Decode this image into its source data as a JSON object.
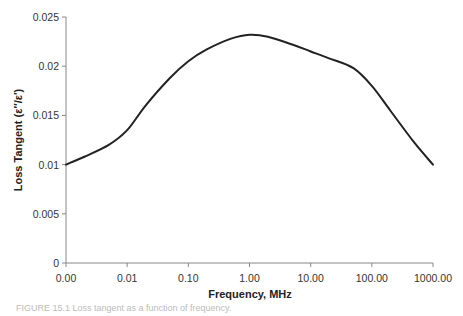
{
  "chart_data": {
    "type": "line",
    "title": "",
    "xlabel": "Frequency, MHz",
    "ylabel": "Loss Tangent (ε″/ε′)",
    "x_scale": "log",
    "x_tick_labels": [
      "0.00",
      "0.01",
      "0.10",
      "1.00",
      "10.00",
      "100.00",
      "1000.00"
    ],
    "y_tick_labels": [
      "0",
      "0.005",
      "0.01",
      "0.015",
      "0.02",
      "0.025"
    ],
    "y_ticks": [
      0,
      0.005,
      0.01,
      0.015,
      0.02,
      0.025
    ],
    "ylim": [
      0,
      0.025
    ],
    "grid": false,
    "legend": null,
    "series": [
      {
        "name": "Loss Tangent",
        "color": "#222222",
        "x": [
          0.001,
          0.002,
          0.005,
          0.01,
          0.02,
          0.05,
          0.1,
          0.2,
          0.5,
          1.0,
          2.0,
          5.0,
          10.0,
          20.0,
          50.0,
          100.0,
          200.0,
          500.0,
          1000.0
        ],
        "values": [
          0.01,
          0.0108,
          0.012,
          0.0135,
          0.016,
          0.0188,
          0.0205,
          0.0217,
          0.0228,
          0.0232,
          0.023,
          0.0222,
          0.0215,
          0.0208,
          0.0198,
          0.018,
          0.0155,
          0.0122,
          0.01
        ]
      }
    ]
  },
  "caption": "FIGURE 15.1  Loss tangent as a function of frequency."
}
